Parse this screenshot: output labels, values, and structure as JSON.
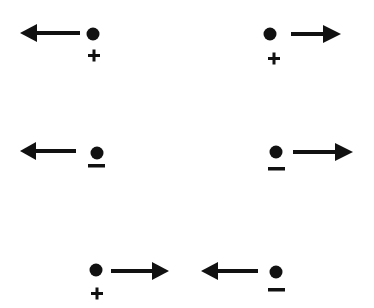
{
  "diagram": {
    "colors": {
      "ink": "#111111",
      "background": "#ffffff"
    },
    "items": [
      {
        "id": "row1-left",
        "charge": "+",
        "arrow_direction": "left",
        "charge_symbol": "plus-sign"
      },
      {
        "id": "row1-right",
        "charge": "+",
        "arrow_direction": "right",
        "charge_symbol": "plus-sign"
      },
      {
        "id": "row2-left",
        "charge": "-",
        "arrow_direction": "left",
        "charge_symbol": "minus-sign"
      },
      {
        "id": "row2-right",
        "charge": "-",
        "arrow_direction": "right",
        "charge_symbol": "minus-sign"
      },
      {
        "id": "row3-left",
        "charge": "+",
        "arrow_direction": "right",
        "charge_symbol": "plus-sign"
      },
      {
        "id": "row3-right",
        "charge": "-",
        "arrow_direction": "left",
        "charge_symbol": "minus-sign"
      }
    ]
  }
}
